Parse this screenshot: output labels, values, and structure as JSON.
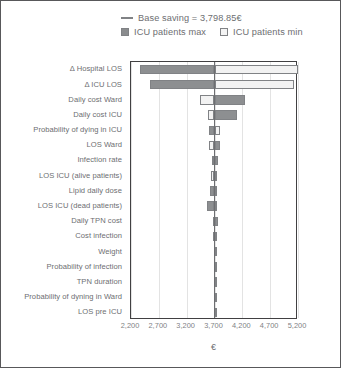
{
  "legend": {
    "base_saving": {
      "label": "Base saving = 3,798.85€",
      "icon": "horizontal-line-marker",
      "color": "#808285"
    },
    "series": [
      {
        "label": "ICU patients max",
        "icon": "filled-square-swatch",
        "color": "#8d8f91"
      },
      {
        "label": "ICU patients min",
        "icon": "empty-square-swatch",
        "color": "#f2f2f2"
      }
    ]
  },
  "axis": {
    "x_title": "€",
    "x_ticks": [
      "2,200",
      "2,700",
      "3,200",
      "3,700",
      "4,200",
      "4,700",
      "5,200"
    ],
    "x_tick_values": [
      2200,
      2700,
      3200,
      3700,
      4200,
      4700,
      5200
    ],
    "xlim": [
      2200,
      5200
    ]
  },
  "chart_data": {
    "type": "bar",
    "subtype": "tornado",
    "title": "",
    "xlabel": "€",
    "ylabel": "",
    "xlim": [
      2200,
      5200
    ],
    "grid": true,
    "legend_position": "top",
    "base_value": 3798.85,
    "base_value_label": "Base saving = 3,798.85€",
    "categories": [
      "Δ Hospital LOS",
      "Δ ICU LOS",
      "Daily cost Ward",
      "Daily cost ICU",
      "Probability of dying in ICU",
      "LOS Ward",
      "Infection rate",
      "LOS ICU (alive patients)",
      "Lipid daily dose",
      "LOS ICU (dead patients)",
      "Daily TPN cost",
      "Cost infection",
      "Weight",
      "Probability of infection",
      "TPN duration",
      "Probability of dyning in Ward",
      "LOS pre ICU"
    ],
    "series": [
      {
        "name": "ICU patients max",
        "color": "#8d8f91",
        "values": [
          2360,
          2540,
          4250,
          4110,
          3960,
          3720,
          3860,
          3760,
          3840,
          3700,
          3770,
          3725,
          3710,
          3705,
          3700,
          3700,
          3700
        ]
      },
      {
        "name": "ICU patients min",
        "color": "#f2f2f2",
        "values": [
          5270,
          5120,
          3440,
          3590,
          3720,
          3900,
          3700,
          3830,
          3700,
          3560,
          3700,
          3690,
          3700,
          3700,
          3700,
          3700,
          3700
        ]
      }
    ],
    "bars": [
      {
        "category": "Δ Hospital LOS",
        "max_from": 2360,
        "max_to": 3700,
        "min_from": 3700,
        "min_to": 5270
      },
      {
        "category": "Δ ICU LOS",
        "max_from": 2540,
        "max_to": 3700,
        "min_from": 3700,
        "min_to": 5120
      },
      {
        "category": "Daily cost Ward",
        "max_from": 3700,
        "max_to": 4250,
        "min_from": 3440,
        "min_to": 3700
      },
      {
        "category": "Daily cost ICU",
        "max_from": 3700,
        "max_to": 4110,
        "min_from": 3590,
        "min_to": 3700
      },
      {
        "category": "Probability of dying in ICU",
        "max_from": 3600,
        "max_to": 3700,
        "min_from": 3700,
        "min_to": 3800
      },
      {
        "category": "LOS Ward",
        "max_from": 3700,
        "max_to": 3790,
        "min_from": 3600,
        "min_to": 3700
      },
      {
        "category": "Infection rate",
        "max_from": 3700,
        "max_to": 3760,
        "min_from": 3660,
        "min_to": 3700
      },
      {
        "category": "LOS ICU (alive patients)",
        "max_from": 3700,
        "max_to": 3740,
        "min_from": 3630,
        "min_to": 3700
      },
      {
        "category": "Lipid daily dose",
        "max_from": 3620,
        "max_to": 3700,
        "min_from": 3700,
        "min_to": 3740
      },
      {
        "category": "LOS ICU (dead patients)",
        "max_from": 3560,
        "max_to": 3700,
        "min_from": 3700,
        "min_to": 3720
      },
      {
        "category": "Daily TPN cost",
        "max_from": 3700,
        "max_to": 3760,
        "min_from": 3680,
        "min_to": 3700
      },
      {
        "category": "Cost infection",
        "max_from": 3680,
        "max_to": 3700,
        "min_from": 3700,
        "min_to": 3730
      },
      {
        "category": "Weight",
        "max_from": 3690,
        "max_to": 3700,
        "min_from": 3700,
        "min_to": 3715
      },
      {
        "category": "Probability of infection",
        "max_from": 3693,
        "max_to": 3700,
        "min_from": 3700,
        "min_to": 3708
      },
      {
        "category": "TPN duration",
        "max_from": 3696,
        "max_to": 3700,
        "min_from": 3700,
        "min_to": 3704
      },
      {
        "category": "Probability of dyning in Ward",
        "max_from": 3698,
        "max_to": 3700,
        "min_from": 3700,
        "min_to": 3702
      },
      {
        "category": "LOS pre ICU",
        "max_from": 3699,
        "max_to": 3700,
        "min_from": 3700,
        "min_to": 3701
      }
    ]
  }
}
